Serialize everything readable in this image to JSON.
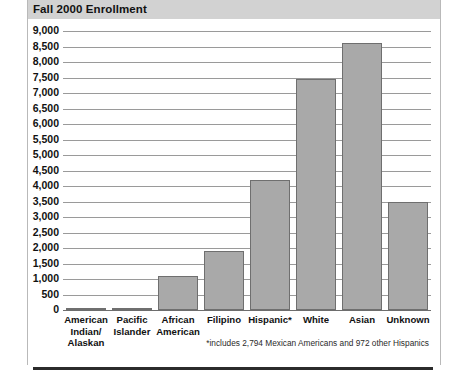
{
  "chart_data": {
    "type": "bar",
    "title": "Fall 2000 Enrollment",
    "xlabel": "",
    "ylabel": "",
    "ylim": [
      0,
      9000
    ],
    "ytick_step": 500,
    "grid": true,
    "legend": false,
    "categories": [
      "American Indian/ Alaskan",
      "Pacific Islander",
      "African American",
      "Filipino",
      "Hispanic*",
      "White",
      "Asian",
      "Unknown"
    ],
    "values": [
      70,
      80,
      1100,
      1900,
      4200,
      7450,
      8600,
      3500
    ],
    "yticks": [
      "9,000",
      "8,500",
      "8,000",
      "7,500",
      "7,000",
      "6,500",
      "6,000",
      "5,500",
      "5,000",
      "4,500",
      "4,000",
      "3,500",
      "3,000",
      "2,500",
      "2,000",
      "1,500",
      "1,000",
      "500",
      "0"
    ],
    "annotations": [
      "*includes 2,794 Mexican Americans and 972 other Hispanics"
    ],
    "colors": {
      "bar_fill": "#a9a9a9",
      "bar_stroke": "#6f6f6f",
      "gridline": "#9a9a9a",
      "title_band": "#d2d2d2",
      "text": "#111111"
    }
  },
  "labels": {
    "category_lines": [
      [
        "American",
        "Indian/",
        "Alaskan"
      ],
      [
        "Pacific",
        "Islander"
      ],
      [
        "African",
        "American"
      ],
      [
        "Filipino"
      ],
      [
        "Hispanic*"
      ],
      [
        "White"
      ],
      [
        "Asian"
      ],
      [
        "Unknown"
      ]
    ]
  }
}
